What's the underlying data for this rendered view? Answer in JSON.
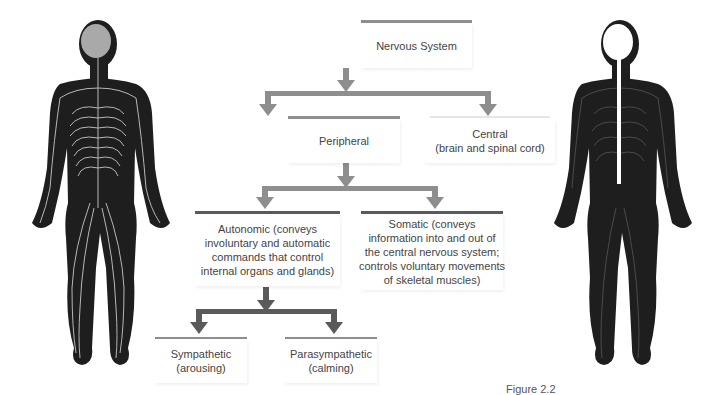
{
  "diagram": {
    "root": {
      "label": "Nervous System"
    },
    "level1": [
      {
        "id": "peripheral",
        "lines": [
          "Peripheral"
        ]
      },
      {
        "id": "central",
        "lines": [
          "Central",
          "(brain and spinal cord)"
        ]
      }
    ],
    "level2": [
      {
        "id": "autonomic",
        "lines": [
          "Autonomic (conveys",
          "involuntary and automatic",
          "commands that control",
          "internal organs and glands)"
        ]
      },
      {
        "id": "somatic",
        "lines": [
          "Somatic (conveys",
          "information into and out of",
          "the central nervous system;",
          "controls voluntary movements",
          "of skeletal muscles)"
        ]
      }
    ],
    "level3": [
      {
        "id": "sympathetic",
        "lines": [
          "Sympathetic",
          "(arousing)"
        ]
      },
      {
        "id": "parasympathetic",
        "lines": [
          "Parasympathetic",
          "(calming)"
        ]
      }
    ]
  },
  "illustrations": {
    "left": {
      "label": "peripheral-nervous-system-figure"
    },
    "right": {
      "label": "central-nervous-system-figure"
    }
  },
  "caption": {
    "text": "Figure 2.2"
  },
  "colors": {
    "arrow_light": "#8e8e8e",
    "arrow_dark": "#5a5a5a",
    "body": "#1e1e1e",
    "nerves": "#c8c8c8"
  }
}
